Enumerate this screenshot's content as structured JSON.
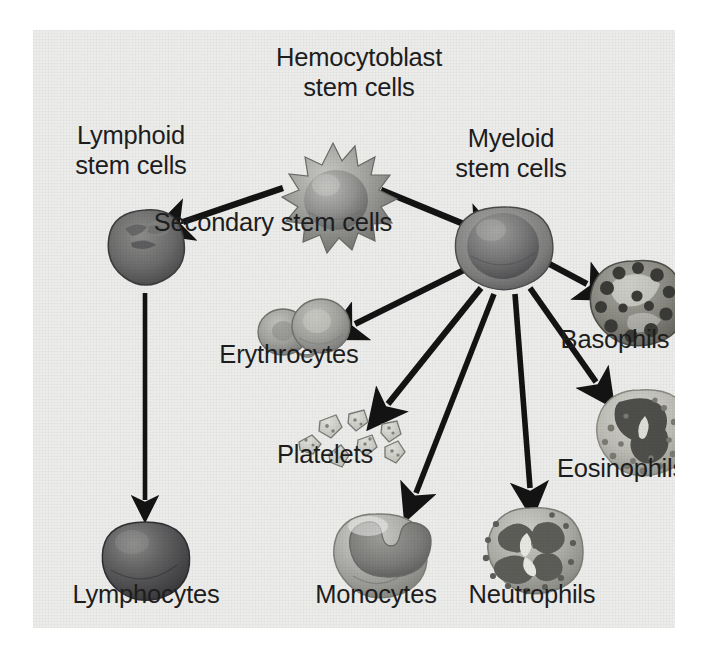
{
  "figure": {
    "background_color": "#ececeb",
    "text_color": "#1d1d1d",
    "arrow_color": "#131313"
  },
  "labels": {
    "hemocytoblast": "Hemocytoblast\nstem cells",
    "lymphoid": "Lymphoid\nstem cells",
    "myeloid": "Myeloid\nstem cells",
    "secondary": "Secondary stem cells",
    "erythrocytes": "Erythrocytes",
    "platelets": "Platelets",
    "basophils": "Basophils",
    "eosinophils": "Eosinophils",
    "lymphocytes": "Lymphocytes",
    "monocytes": "Monocytes",
    "neutrophils": "Neutrophils"
  },
  "cells": [
    {
      "id": "hemocytoblast",
      "label": "Hemocytoblast stem cells",
      "shape": "spiky-stem-cell",
      "x": 300,
      "y": 163
    },
    {
      "id": "lymphoid",
      "label": "Lymphoid stem cells",
      "shape": "lymphoid-stem-cell",
      "x": 112,
      "y": 218
    },
    {
      "id": "myeloid",
      "label": "Myeloid stem cells",
      "shape": "myeloid-stem-cell",
      "x": 471,
      "y": 217
    },
    {
      "id": "erythrocytes",
      "label": "Erythrocytes",
      "shape": "biconcave-discs",
      "x": 272,
      "y": 300
    },
    {
      "id": "platelets",
      "label": "Platelets",
      "shape": "platelet-fragments",
      "x": 312,
      "y": 400
    },
    {
      "id": "basophils",
      "label": "Basophils",
      "shape": "granular-dark-cell",
      "x": 601,
      "y": 284
    },
    {
      "id": "eosinophils",
      "label": "Eosinophils",
      "shape": "bilobed-granular-cell",
      "x": 607,
      "y": 412
    },
    {
      "id": "lymphocytes",
      "label": "Lymphocytes",
      "shape": "dark-round-cell",
      "x": 112,
      "y": 538
    },
    {
      "id": "monocytes",
      "label": "Monocytes",
      "shape": "kidney-nucleus-cell",
      "x": 343,
      "y": 533
    },
    {
      "id": "neutrophils",
      "label": "Neutrophils",
      "shape": "multilobed-nucleus-cell",
      "x": 497,
      "y": 528
    }
  ],
  "arrows": [
    {
      "id": "hemocytoblast-to-lymphoid",
      "from": "hemocytoblast",
      "to": "lymphoid"
    },
    {
      "id": "hemocytoblast-to-myeloid",
      "from": "hemocytoblast",
      "to": "myeloid"
    },
    {
      "id": "lymphoid-to-lymphocytes",
      "from": "lymphoid",
      "to": "lymphocytes"
    },
    {
      "id": "myeloid-to-erythrocytes",
      "from": "myeloid",
      "to": "erythrocytes"
    },
    {
      "id": "myeloid-to-platelets",
      "from": "myeloid",
      "to": "platelets"
    },
    {
      "id": "myeloid-to-monocytes",
      "from": "myeloid",
      "to": "monocytes"
    },
    {
      "id": "myeloid-to-neutrophils",
      "from": "myeloid",
      "to": "neutrophils"
    },
    {
      "id": "myeloid-to-eosinophils",
      "from": "myeloid",
      "to": "eosinophils"
    },
    {
      "id": "myeloid-to-basophils",
      "from": "myeloid",
      "to": "basophils"
    }
  ]
}
